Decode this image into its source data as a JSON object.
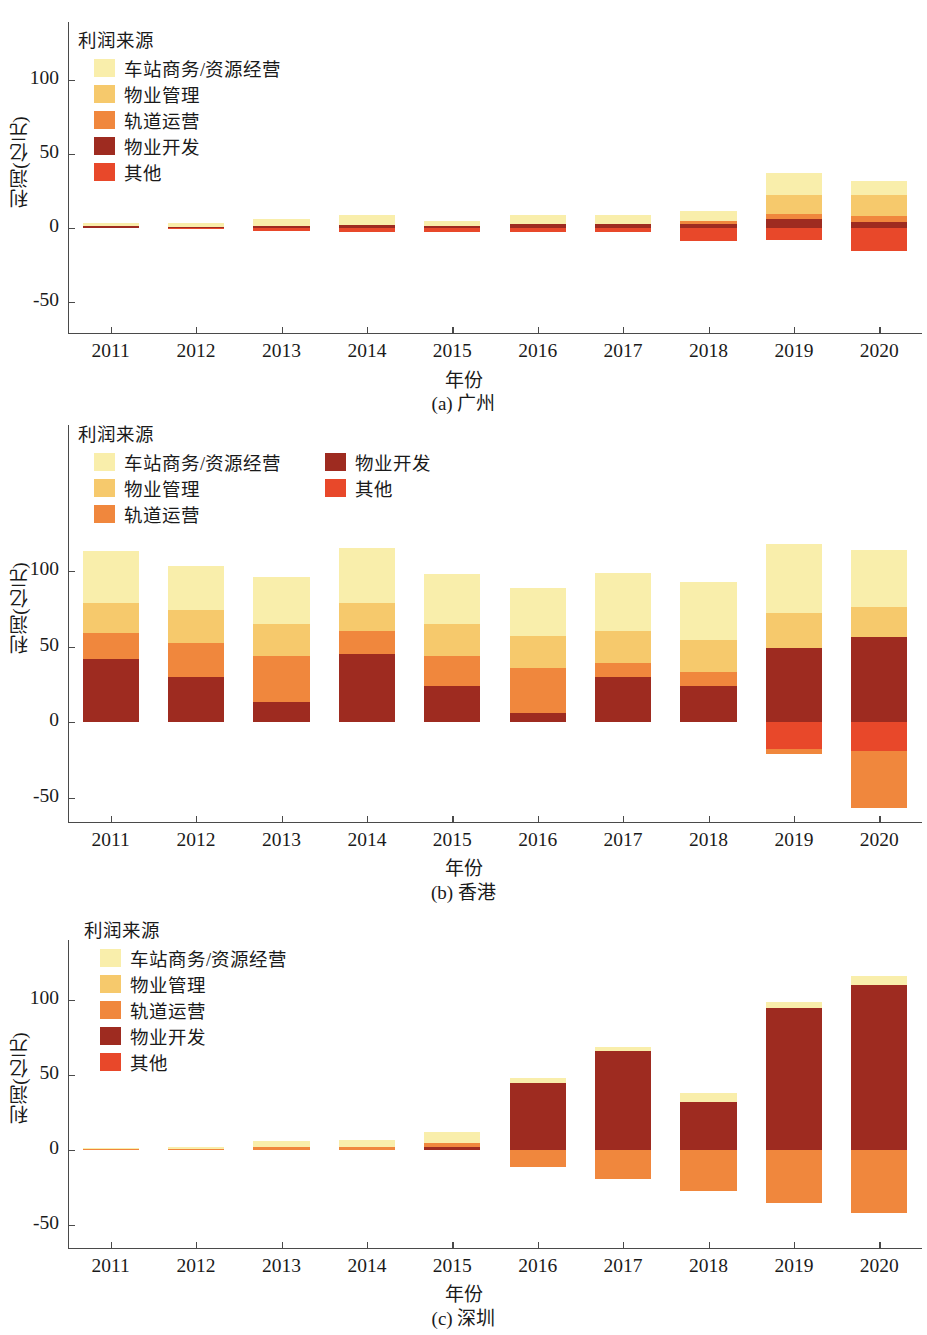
{
  "legend": {
    "title": "利润来源",
    "entries": [
      {
        "label": "车站商务/资源经营",
        "color": "#f9eeab"
      },
      {
        "label": "物业管理",
        "color": "#f6c96c"
      },
      {
        "label": "轨道运营",
        "color": "#f0873d"
      },
      {
        "label": "物业开发",
        "color": "#9e2b20"
      },
      {
        "label": "其他",
        "color": "#e8482a"
      }
    ]
  },
  "axis": {
    "ylabel": "利润(亿元)",
    "xlabel": "年份",
    "yticks": [
      "100",
      "50",
      "0",
      "-50"
    ],
    "xticks": [
      "2011",
      "2012",
      "2013",
      "2014",
      "2015",
      "2016",
      "2017",
      "2018",
      "2019",
      "2020"
    ]
  },
  "panels": [
    {
      "id": "a",
      "caption": "(a) 广州",
      "legend_columns": 1
    },
    {
      "id": "b",
      "caption": "(b) 香港",
      "legend_columns": 2
    },
    {
      "id": "c",
      "caption": "(c) 深圳",
      "legend_columns": 1
    }
  ],
  "chart_data": [
    {
      "type": "bar",
      "stacked": true,
      "title": "(a) 广州",
      "xlabel": "年份",
      "ylabel": "利润(亿元)",
      "ylim": [
        -65,
        130
      ],
      "yticks": [
        100,
        50,
        0,
        -50
      ],
      "grid": false,
      "legend": "upper left",
      "categories": [
        "2011",
        "2012",
        "2013",
        "2014",
        "2015",
        "2016",
        "2017",
        "2018",
        "2019",
        "2020"
      ],
      "series": [
        {
          "name": "车站商务/资源经营",
          "color": "#f9eeab",
          "values": [
            2.0,
            2.5,
            4.5,
            7.0,
            3.0,
            6.0,
            6.0,
            6.5,
            14.5,
            10.0
          ]
        },
        {
          "name": "物业管理",
          "color": "#f6c96c",
          "values": [
            0.0,
            0.0,
            0.0,
            0.0,
            0.0,
            0.0,
            0.0,
            0.0,
            13.0,
            14.0
          ]
        },
        {
          "name": "轨道运营",
          "color": "#f0873d",
          "values": [
            0.0,
            0.0,
            0.0,
            0.0,
            0.0,
            0.0,
            0.0,
            2.5,
            3.5,
            4.0
          ]
        },
        {
          "name": "物业开发",
          "color": "#9e2b20",
          "values": [
            1.5,
            1.0,
            1.5,
            2.0,
            1.5,
            3.0,
            3.0,
            2.5,
            6.0,
            4.0
          ]
        },
        {
          "name": "其他",
          "color": "#e8482a",
          "values": [
            0.0,
            -1.0,
            -2.0,
            -2.5,
            -2.5,
            -2.5,
            -2.5,
            -8.5,
            -8.0,
            -15.5
          ]
        }
      ]
    },
    {
      "type": "bar",
      "stacked": true,
      "title": "(b) 香港",
      "xlabel": "年份",
      "ylabel": "利润(亿元)",
      "ylim": [
        -65,
        145
      ],
      "yticks": [
        100,
        50,
        0,
        -50
      ],
      "grid": false,
      "legend": "upper left",
      "categories": [
        "2011",
        "2012",
        "2013",
        "2014",
        "2015",
        "2016",
        "2017",
        "2018",
        "2019",
        "2020"
      ],
      "series": [
        {
          "name": "车站商务/资源经营",
          "color": "#f9eeab",
          "values": [
            34,
            29,
            31,
            36,
            33,
            32,
            39,
            39,
            46,
            38
          ]
        },
        {
          "name": "物业管理",
          "color": "#f6c96c",
          "values": [
            20,
            22,
            21,
            19,
            21,
            21,
            21,
            21,
            23,
            20
          ]
        },
        {
          "name": "轨道运营",
          "color": "#f0873d",
          "values": [
            17,
            22,
            31,
            15,
            20,
            30,
            9,
            9,
            0,
            0
          ]
        },
        {
          "name": "物业开发",
          "color": "#9e2b20",
          "values": [
            42,
            30,
            13,
            45,
            24,
            6,
            30,
            24,
            49,
            56
          ]
        },
        {
          "name": "其他",
          "color": "#e8482a",
          "values": [
            0,
            0,
            0,
            0,
            0,
            0,
            0,
            0,
            -18,
            -19
          ]
        },
        {
          "name": "轨道运营(负)",
          "color": "#f0873d",
          "values": [
            0,
            0,
            0,
            0,
            0,
            0,
            0,
            0,
            -3,
            -38
          ]
        }
      ]
    },
    {
      "type": "bar",
      "stacked": true,
      "title": "(c) 深圳",
      "xlabel": "年份",
      "ylabel": "利润(亿元)",
      "ylim": [
        -60,
        135
      ],
      "yticks": [
        100,
        50,
        0,
        -50
      ],
      "grid": false,
      "legend": "upper left",
      "categories": [
        "2011",
        "2012",
        "2013",
        "2014",
        "2015",
        "2016",
        "2017",
        "2018",
        "2019",
        "2020"
      ],
      "series": [
        {
          "name": "车站商务/资源经营",
          "color": "#f9eeab",
          "values": [
            0.5,
            1.0,
            4.0,
            5.0,
            7.0,
            3.0,
            3.0,
            6.0,
            4.0,
            6.0
          ]
        },
        {
          "name": "物业管理",
          "color": "#f6c96c",
          "values": [
            0.0,
            0.0,
            0.0,
            0.0,
            0.0,
            0.0,
            0.0,
            0.0,
            0.0,
            0.0
          ]
        },
        {
          "name": "轨道运营",
          "color": "#f0873d",
          "values": [
            1.0,
            1.0,
            2.0,
            2.0,
            3.0,
            0.0,
            0.0,
            0.0,
            0.0,
            0.0
          ]
        },
        {
          "name": "物业开发",
          "color": "#9e2b20",
          "values": [
            0.0,
            0.0,
            0.0,
            0.0,
            2.0,
            45.0,
            66.0,
            32.0,
            95.0,
            110.0
          ]
        },
        {
          "name": "其他",
          "color": "#e8482a",
          "values": [
            0,
            0,
            0,
            0,
            0,
            0,
            0,
            0,
            0,
            0
          ]
        },
        {
          "name": "轨道运营(负)",
          "color": "#f0873d",
          "values": [
            0,
            0,
            0,
            0,
            0,
            -11,
            -19,
            -27,
            -35,
            -42
          ]
        }
      ]
    }
  ]
}
